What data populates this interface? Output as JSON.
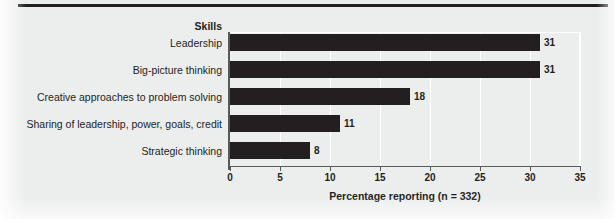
{
  "chart_data": {
    "type": "bar",
    "orientation": "horizontal",
    "title": "",
    "category_header": "Skills",
    "categories": [
      "Leadership",
      "Big-picture thinking",
      "Creative approaches to problem solving",
      "Sharing of leadership, power, goals, credit",
      "Strategic thinking"
    ],
    "values": [
      31,
      31,
      18,
      11,
      8
    ],
    "value_labels": [
      "31",
      "31",
      "18",
      "11",
      "8"
    ],
    "xlabel": "Percentage reporting (n = 332)",
    "ylabel": "Skills",
    "xlim": [
      0,
      35
    ],
    "xticks": [
      0,
      5,
      10,
      15,
      20,
      25,
      30,
      35
    ],
    "xtick_labels": [
      "0",
      "5",
      "10",
      "15",
      "20",
      "25",
      "30",
      "35"
    ],
    "grid": "vertical-white",
    "legend": null,
    "colors": {
      "bar": "#231f20",
      "background": "#eceded",
      "axis": "#58595b",
      "gridline": "#ffffff",
      "text": "#231f20",
      "top_rule": "#231f20"
    }
  }
}
